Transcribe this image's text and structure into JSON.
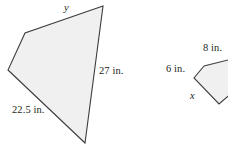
{
  "figure": {
    "kind": "geometry-similar-polygons",
    "background_color": "#ffffff",
    "stroke_color": "#3d3d42",
    "fill_color": "#f0f0f0",
    "label_color": "#231f20",
    "shapes": [
      {
        "name": "large-quadrilateral",
        "vertices": [
          [
            103,
            6
          ],
          [
            25,
            33
          ],
          [
            8,
            70
          ],
          [
            85,
            143
          ]
        ],
        "clipped": false
      },
      {
        "name": "small-quadrilateral",
        "vertices": [
          [
            204,
            66
          ],
          [
            194,
            78
          ],
          [
            219,
            104
          ],
          [
            240,
            86
          ],
          [
            236,
            58
          ]
        ],
        "clipped": true
      }
    ],
    "labels": [
      {
        "id": "label-y",
        "text": "y",
        "kind": "variable",
        "shape": "large-quadrilateral",
        "side": "top"
      },
      {
        "id": "label-27in",
        "text": "27 in.",
        "kind": "measure",
        "shape": "large-quadrilateral",
        "side": "right"
      },
      {
        "id": "label-22p5in",
        "text": "22.5 in.",
        "kind": "measure",
        "shape": "large-quadrilateral",
        "side": "bottom-left"
      },
      {
        "id": "label-8in",
        "text": "8 in.",
        "kind": "measure",
        "shape": "small-quadrilateral",
        "side": "top"
      },
      {
        "id": "label-6in",
        "text": "6 in.",
        "kind": "measure",
        "shape": "small-quadrilateral",
        "side": "upper-left"
      },
      {
        "id": "label-x",
        "text": "x",
        "kind": "variable",
        "shape": "small-quadrilateral",
        "side": "lower-left"
      }
    ]
  }
}
